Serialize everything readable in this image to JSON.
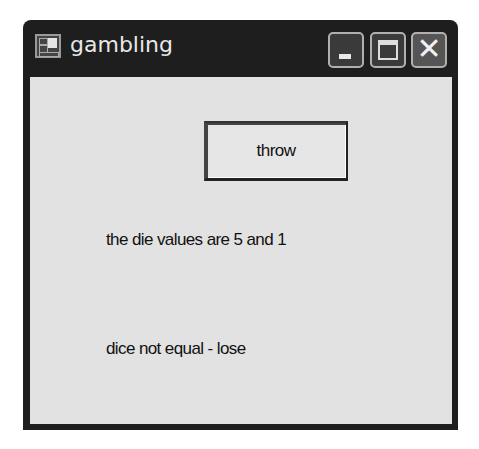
{
  "window": {
    "title": "gambling",
    "icon": "app-window-icon",
    "controls": {
      "minimize": "minimize-icon",
      "maximize": "maximize-icon",
      "close": "close-icon"
    },
    "colors": {
      "titlebar": "#1e1e1e",
      "client": "#e2e2e2",
      "text": "#111111"
    }
  },
  "form": {
    "throw_button_label": "throw",
    "die_values_label": "the die values are 5 and 1",
    "result_label": "dice not equal - lose",
    "die_values": [
      5,
      1
    ]
  }
}
